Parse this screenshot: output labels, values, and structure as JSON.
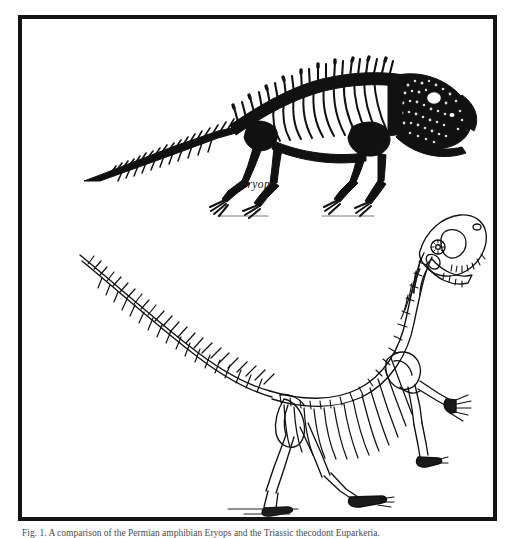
{
  "plate": {
    "background_color": "#ffffff",
    "frame_color": "#141414",
    "ink_color": "#111111",
    "caption": "Fig. 1. A comparison of the Permian amphibian Eryops and the Triassic thecodont Euparkeria."
  },
  "specimens": [
    {
      "id": "eryops",
      "label": "Eryops",
      "style": "solid-black-engraving",
      "posture": "sprawling quadruped",
      "facing": "right"
    },
    {
      "id": "euparkeria",
      "label": "Euparkeria",
      "style": "line-outline-drawing",
      "posture": "erect biped",
      "facing": "right"
    }
  ]
}
